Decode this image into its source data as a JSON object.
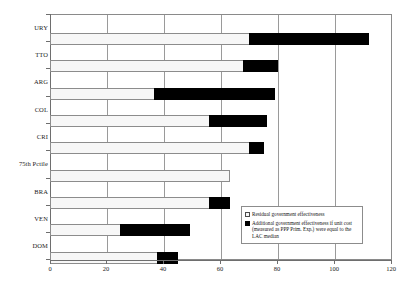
{
  "chart_data": {
    "type": "bar",
    "orientation": "horizontal",
    "stacked": true,
    "title": "",
    "xlabel": "",
    "ylabel": "",
    "xlim": [
      0,
      120
    ],
    "xticks": [
      0,
      20,
      40,
      60,
      80,
      100,
      120
    ],
    "grid": true,
    "grid_axis": "x",
    "legend_position": "inside-lower-right",
    "categories": [
      "URY",
      "TTO",
      "ARG",
      "COL",
      "CRI",
      "75th Pctile",
      "BRA",
      "VEN",
      "DOM"
    ],
    "series": [
      {
        "name": "Residual government effectiveness",
        "color": "#f7f7f7",
        "values": [
          70,
          68,
          37,
          56,
          70,
          63,
          56,
          25,
          38
        ]
      },
      {
        "name": "Additional government effectiveness if unit cost (measured as PPP Prim. Exp.) were equal to the LAC median",
        "color": "#000000",
        "values": [
          42,
          12,
          42,
          20,
          5,
          0,
          7,
          24,
          7
        ]
      }
    ],
    "totals": [
      112,
      80,
      79,
      76,
      75,
      63,
      63,
      49,
      45
    ]
  },
  "legend": {
    "entries": [
      {
        "icon": "legend-swatch-residual",
        "label": "Residual government effectiveness"
      },
      {
        "icon": "legend-swatch-additional",
        "label": "Additional government effectiveness if unit cost (measured as PPP Prim. Exp.) were equal to the LAC median"
      }
    ]
  },
  "caption": {
    "text": ""
  }
}
